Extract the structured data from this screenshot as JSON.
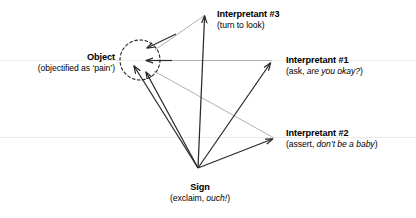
{
  "diagram": {
    "background": "#ffffff",
    "stroke_dark": "#2b2b2b",
    "stroke_light": "#a8a8a8",
    "stroke_faint": "#e6e6e6",
    "nodes": {
      "object": {
        "title": "Object",
        "subtitle_prefix": "(objectified as ‘pain’)",
        "shape": "dashed-circle",
        "cx": 140,
        "cy": 60,
        "r": 20
      },
      "sign": {
        "title": "Sign",
        "subtitle_prefix": "(exclaim, ",
        "subtitle_emphasis": "ouch!",
        "subtitle_suffix": ")",
        "x": 198,
        "y": 168
      },
      "interpretant1": {
        "title": "Interpretant #1",
        "subtitle_prefix": "(ask, ",
        "subtitle_emphasis": "are you okay?",
        "subtitle_suffix": ")",
        "x": 272,
        "y": 61
      },
      "interpretant2": {
        "title": "Interpretant #2",
        "subtitle_prefix": "(assert, ",
        "subtitle_emphasis": "don’t be a baby",
        "subtitle_suffix": ")",
        "x": 274,
        "y": 139
      },
      "interpretant3": {
        "title": "Interpretant #3",
        "subtitle_prefix": "(turn to look)",
        "x": 205,
        "y": 13
      }
    }
  }
}
